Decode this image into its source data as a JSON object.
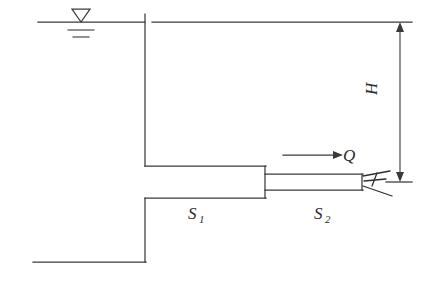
{
  "figure": {
    "type": "engineering-schematic",
    "background_color": "#ffffff",
    "line_color": "#3a3a3a"
  },
  "labels": {
    "head": "H",
    "discharge": "Q",
    "pipe_section_1": "S",
    "pipe_section_1_sub": "1",
    "pipe_section_2": "S",
    "pipe_section_2_sub": "2"
  },
  "annotations": {
    "water_surface_symbol": "free-surface-triangle",
    "flow_arrow": "flow-direction-arrow",
    "dimension": "head-dimension-H",
    "jet": "nozzle-jet"
  },
  "geometry": {
    "water_line_y": 22,
    "datum_line_y": 22,
    "reservoir_wall_x": 145,
    "pipe1_top_y": 166,
    "pipe1_bottom_y": 198,
    "pipe1_start_x": 145,
    "pipe1_end_x": 265,
    "pipe2_top_y": 174,
    "pipe2_bottom_y": 190,
    "pipe2_start_x": 265,
    "pipe2_end_x": 362,
    "nozzle_outlet_y": 182,
    "ground_y": 262,
    "dimension_line_x": 400,
    "dimension_top_y": 22,
    "dimension_bottom_y": 182
  }
}
